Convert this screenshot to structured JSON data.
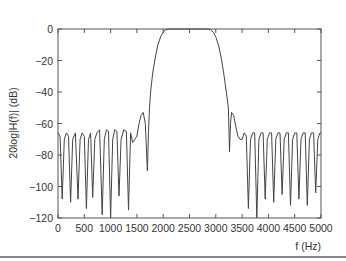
{
  "chart_data": {
    "type": "line",
    "title": "",
    "xlabel": "f (Hz)",
    "ylabel": "20log|H(f)| (dB)",
    "xlim": [
      0,
      5000
    ],
    "ylim": [
      -120,
      0
    ],
    "grid": false,
    "legend": null,
    "x_ticks": [
      0,
      500,
      1000,
      1500,
      2000,
      2500,
      3000,
      3500,
      4000,
      4500,
      5000
    ],
    "y_ticks": [
      0,
      -20,
      -40,
      -60,
      -80,
      -100,
      -120
    ],
    "x_tick_labels": [
      "0",
      "500",
      "1000",
      "1500",
      "2000",
      "2500",
      "3000",
      "3500",
      "4000",
      "4500",
      "5000"
    ],
    "y_tick_labels": [
      "0",
      "−20",
      "−40",
      "−60",
      "−80",
      "−100",
      "−120"
    ],
    "series": [
      {
        "name": "magnitude",
        "x": [
          0,
          40,
          80,
          120,
          160,
          200,
          240,
          280,
          330,
          380,
          420,
          460,
          500,
          540,
          580,
          620,
          660,
          700,
          740,
          790,
          840,
          880,
          920,
          960,
          1000,
          1040,
          1080,
          1120,
          1160,
          1200,
          1250,
          1300,
          1340,
          1380,
          1420,
          1460,
          1500,
          1540,
          1580,
          1620,
          1660,
          1700,
          1720,
          1740,
          1760,
          1800,
          1850,
          1900,
          1950,
          2000,
          2050,
          2100,
          2150,
          2200,
          2250,
          2300,
          2400,
          2500,
          2600,
          2700,
          2750,
          2800,
          2850,
          2900,
          2950,
          3000,
          3050,
          3100,
          3150,
          3200,
          3240,
          3260,
          3280,
          3300,
          3340,
          3380,
          3420,
          3460,
          3500,
          3540,
          3580,
          3620,
          3660,
          3700,
          3740,
          3780,
          3820,
          3860,
          3900,
          3940,
          3980,
          4020,
          4060,
          4100,
          4140,
          4180,
          4220,
          4260,
          4300,
          4340,
          4380,
          4420,
          4460,
          4500,
          4540,
          4580,
          4620,
          4660,
          4700,
          4740,
          4780,
          4820,
          4860,
          4900,
          4940,
          4980,
          5000
        ],
        "y": [
          -66,
          -68,
          -108,
          -70,
          -66,
          -68,
          -110,
          -70,
          -66,
          -108,
          -70,
          -66,
          -68,
          -114,
          -70,
          -66,
          -107,
          -70,
          -66,
          -64,
          -118,
          -70,
          -64,
          -65,
          -120,
          -70,
          -64,
          -65,
          -106,
          -70,
          -64,
          -65,
          -115,
          -66,
          -72,
          -70,
          -68,
          -60,
          -55,
          -53,
          -60,
          -90,
          -65,
          -50,
          -40,
          -28,
          -18,
          -10,
          -5,
          -2,
          -0.5,
          0,
          0,
          0,
          0,
          0,
          0,
          0,
          0,
          0,
          0,
          0,
          0,
          -0.5,
          -2,
          -5,
          -10,
          -18,
          -28,
          -40,
          -50,
          -78,
          -60,
          -53,
          -55,
          -62,
          -68,
          -70,
          -70,
          -66,
          -68,
          -114,
          -70,
          -66,
          -66,
          -120,
          -70,
          -66,
          -66,
          -108,
          -70,
          -66,
          -66,
          -110,
          -70,
          -66,
          -66,
          -105,
          -70,
          -66,
          -66,
          -112,
          -70,
          -66,
          -66,
          -108,
          -70,
          -66,
          -66,
          -112,
          -70,
          -66,
          -66,
          -104,
          -70,
          -66,
          -66
        ]
      }
    ]
  }
}
